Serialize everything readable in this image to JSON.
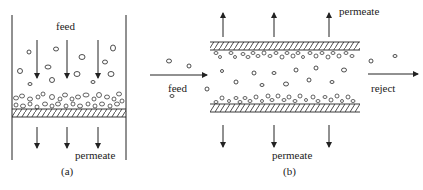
{
  "panel_a": {
    "caption": "(a)",
    "feed_label": "feed",
    "permeate_label": "permeate",
    "description": "dead-end filtration"
  },
  "panel_b": {
    "caption": "(b)",
    "feed_label": "feed",
    "reject_label": "reject",
    "permeate_top_label": "permeate",
    "permeate_bottom_label": "permeate",
    "description": "cross-flow filtration"
  },
  "colors": {
    "line": "#222222",
    "background": "#ffffff"
  }
}
